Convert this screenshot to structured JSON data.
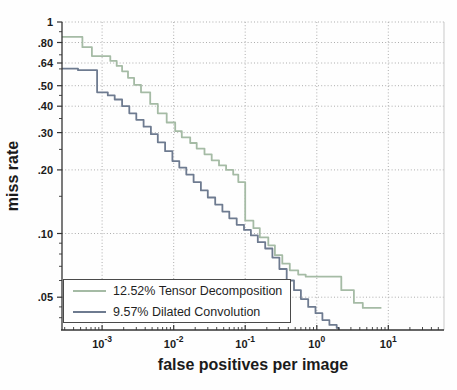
{
  "figure": {
    "xlabel": "false positives per image",
    "ylabel": "miss rate"
  },
  "legend": {
    "position": "lower-left",
    "items": [
      {
        "label": "12.52% Tensor Decomposition",
        "color": "#a5bba5"
      },
      {
        "label": "9.57% Dilated Convolution",
        "color": "#6e7b90"
      }
    ]
  },
  "colors": {
    "grid": "#adadad",
    "axis": "#333333",
    "text": "#1b1b1b",
    "tensor_decomposition": "#a5bba5",
    "dilated_convolution": "#6e7b90"
  },
  "chart_data": {
    "type": "line",
    "title": "",
    "xlabel": "false positives per image",
    "ylabel": "miss rate",
    "x_scale": "log",
    "y_scale": "log",
    "xlim": [
      0.000275,
      60
    ],
    "ylim": [
      0.035,
      1
    ],
    "grid": "dotted",
    "legend_position": "lower-left",
    "x_ticks": [
      {
        "value": 0.001,
        "base": "10",
        "exponent": "-3"
      },
      {
        "value": 0.01,
        "base": "10",
        "exponent": "-2"
      },
      {
        "value": 0.1,
        "base": "10",
        "exponent": "-1"
      },
      {
        "value": 1,
        "base": "10",
        "exponent": "0"
      },
      {
        "value": 10,
        "base": "10",
        "exponent": "1"
      }
    ],
    "y_ticks": [
      {
        "value": 1,
        "label": "1"
      },
      {
        "value": 0.8,
        "label": ".80"
      },
      {
        "value": 0.64,
        "label": ".64"
      },
      {
        "value": 0.5,
        "label": ".50"
      },
      {
        "value": 0.4,
        "label": ".40"
      },
      {
        "value": 0.3,
        "label": ".30"
      },
      {
        "value": 0.2,
        "label": ".20"
      },
      {
        "value": 0.1,
        "label": ".10"
      },
      {
        "value": 0.05,
        "label": ".05"
      }
    ],
    "y_minor_ticks": [
      0.9,
      0.7,
      0.6,
      0.45,
      0.35,
      0.25,
      0.15,
      0.09,
      0.08,
      0.07,
      0.06,
      0.045,
      0.04
    ],
    "series": [
      {
        "name": "12.52% Tensor Decomposition",
        "log_avg_miss_rate": "12.52%",
        "color": "#a5bba5",
        "step": true,
        "points": [
          [
            0.000275,
            0.85
          ],
          [
            0.00053,
            0.76
          ],
          [
            0.00072,
            0.69
          ],
          [
            0.0013,
            0.655
          ],
          [
            0.0016,
            0.62
          ],
          [
            0.0019,
            0.585
          ],
          [
            0.0023,
            0.545
          ],
          [
            0.0028,
            0.505
          ],
          [
            0.0035,
            0.465
          ],
          [
            0.0047,
            0.41
          ],
          [
            0.006,
            0.37
          ],
          [
            0.008,
            0.335
          ],
          [
            0.0105,
            0.305
          ],
          [
            0.013,
            0.285
          ],
          [
            0.017,
            0.268
          ],
          [
            0.021,
            0.252
          ],
          [
            0.027,
            0.237
          ],
          [
            0.034,
            0.222
          ],
          [
            0.043,
            0.21
          ],
          [
            0.054,
            0.2
          ],
          [
            0.068,
            0.19
          ],
          [
            0.08,
            0.175
          ],
          [
            0.1,
            0.115
          ],
          [
            0.13,
            0.106
          ],
          [
            0.16,
            0.096
          ],
          [
            0.21,
            0.088
          ],
          [
            0.26,
            0.079
          ],
          [
            0.33,
            0.072
          ],
          [
            0.42,
            0.067
          ],
          [
            0.55,
            0.064
          ],
          [
            0.7,
            0.0625
          ],
          [
            2.2,
            0.054
          ],
          [
            3.3,
            0.047
          ],
          [
            4.4,
            0.0445
          ],
          [
            8.0,
            0.0445
          ]
        ]
      },
      {
        "name": "9.57% Dilated Convolution",
        "log_avg_miss_rate": "9.57%",
        "color": "#6e7b90",
        "step": true,
        "points": [
          [
            0.000275,
            0.602
          ],
          [
            0.00046,
            0.592
          ],
          [
            0.00085,
            0.465
          ],
          [
            0.0012,
            0.45
          ],
          [
            0.0015,
            0.43
          ],
          [
            0.0019,
            0.4
          ],
          [
            0.0024,
            0.37
          ],
          [
            0.003,
            0.345
          ],
          [
            0.0038,
            0.32
          ],
          [
            0.0048,
            0.295
          ],
          [
            0.006,
            0.27
          ],
          [
            0.0076,
            0.245
          ],
          [
            0.0096,
            0.22
          ],
          [
            0.012,
            0.205
          ],
          [
            0.015,
            0.19
          ],
          [
            0.019,
            0.175
          ],
          [
            0.024,
            0.16
          ],
          [
            0.03,
            0.148
          ],
          [
            0.038,
            0.137
          ],
          [
            0.048,
            0.127
          ],
          [
            0.06,
            0.118
          ],
          [
            0.076,
            0.11
          ],
          [
            0.096,
            0.104
          ],
          [
            0.12,
            0.098
          ],
          [
            0.15,
            0.091
          ],
          [
            0.19,
            0.085
          ],
          [
            0.24,
            0.077
          ],
          [
            0.3,
            0.068
          ],
          [
            0.38,
            0.06
          ],
          [
            0.48,
            0.054
          ],
          [
            0.6,
            0.049
          ],
          [
            0.76,
            0.045
          ],
          [
            0.96,
            0.042
          ],
          [
            1.2,
            0.039
          ],
          [
            1.5,
            0.037
          ],
          [
            1.9,
            0.0358
          ],
          [
            2.05,
            0.035
          ]
        ]
      }
    ]
  }
}
